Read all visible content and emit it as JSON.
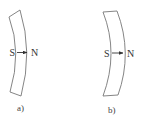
{
  "figures": [
    {
      "id": "a",
      "caption": "a)",
      "south_label": "S",
      "north_label": "N",
      "curvature": "bulges-left",
      "colors": {
        "outline": "#777777",
        "text": "#333333"
      }
    },
    {
      "id": "b",
      "caption": "b)",
      "south_label": "S",
      "north_label": "N",
      "curvature": "bulges-right",
      "colors": {
        "outline": "#777777",
        "text": "#333333"
      }
    }
  ]
}
